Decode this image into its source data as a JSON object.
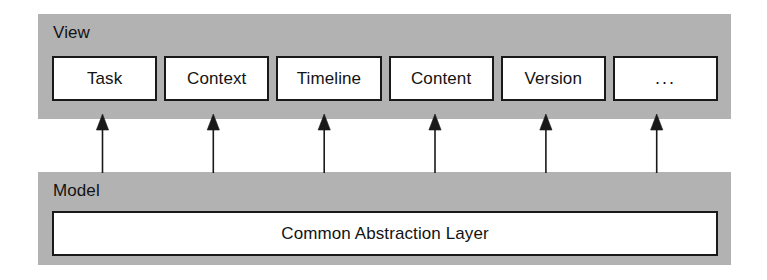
{
  "diagram": {
    "type": "layered-architecture-diagram",
    "colors": {
      "band_gray": "#b2b2b2",
      "box_fill": "#ffffff",
      "stroke": "#191919",
      "text": "#131313",
      "background": "#ffffff"
    },
    "layers": [
      {
        "id": "view",
        "title": "View",
        "components": [
          {
            "label": "Task"
          },
          {
            "label": "Context"
          },
          {
            "label": "Timeline"
          },
          {
            "label": "Content"
          },
          {
            "label": "Version"
          },
          {
            "label": "..."
          }
        ]
      },
      {
        "id": "model",
        "title": "Model",
        "components": [
          {
            "label": "Common Abstraction Layer"
          }
        ]
      }
    ],
    "connectors": {
      "kind": "arrow",
      "direction": "model-to-view",
      "count": 6,
      "arrowhead": "solid-triangle",
      "targets": [
        "Task",
        "Context",
        "Timeline",
        "Content",
        "Version",
        "..."
      ],
      "source": "Common Abstraction Layer"
    }
  }
}
